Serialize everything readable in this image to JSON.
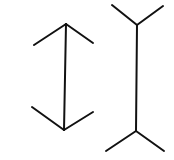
{
  "diagram": {
    "type": "muller-lyer-illusion",
    "background": "#ffffff",
    "stroke_color": "#111111",
    "stroke_width": 2,
    "figures": [
      {
        "name": "arrowheads-inward",
        "shaft": {
          "x1": 66,
          "y1": 24,
          "x2": 64,
          "y2": 130
        },
        "fins": [
          {
            "x1": 66,
            "y1": 24,
            "x2": 34,
            "y2": 45
          },
          {
            "x1": 66,
            "y1": 24,
            "x2": 93,
            "y2": 43
          },
          {
            "x1": 64,
            "y1": 130,
            "x2": 32,
            "y2": 107
          },
          {
            "x1": 64,
            "y1": 130,
            "x2": 93,
            "y2": 112
          }
        ]
      },
      {
        "name": "arrowheads-outward",
        "shaft": {
          "x1": 137,
          "y1": 25,
          "x2": 136,
          "y2": 131
        },
        "fins": [
          {
            "x1": 137,
            "y1": 25,
            "x2": 112,
            "y2": 5
          },
          {
            "x1": 137,
            "y1": 25,
            "x2": 163,
            "y2": 6
          },
          {
            "x1": 136,
            "y1": 131,
            "x2": 106,
            "y2": 151
          },
          {
            "x1": 136,
            "y1": 131,
            "x2": 164,
            "y2": 151
          }
        ]
      }
    ]
  }
}
